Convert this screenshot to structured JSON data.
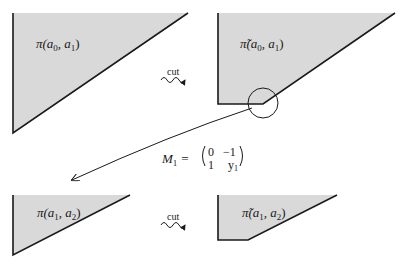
{
  "diagram": {
    "panels": [
      {
        "id": "top-left",
        "label_main": "π",
        "label_args": "(a",
        "sub1": "0",
        "comma": ", a",
        "sub2": "1",
        "close": ")"
      },
      {
        "id": "top-right",
        "label_main": "π̃",
        "label_args": "(a",
        "sub1": "0",
        "comma": ", a",
        "sub2": "1",
        "close": ")"
      },
      {
        "id": "bottom-left",
        "label_main": "π",
        "label_args": "(a",
        "sub1": "1",
        "comma": ", a",
        "sub2": "2",
        "close": ")"
      },
      {
        "id": "bottom-right",
        "label_main": "π̃",
        "label_args": "(a",
        "sub1": "1",
        "comma": ", a",
        "sub2": "2",
        "close": ")"
      }
    ],
    "cut_labels": [
      "cut",
      "cut"
    ],
    "matrix": {
      "name": "M",
      "sub": "1",
      "equals": "=",
      "rows": [
        [
          "0",
          "−1"
        ],
        [
          "1",
          "y"
        ]
      ],
      "y_sub": "1"
    },
    "colors": {
      "fill": "#d9d9d9",
      "stroke": "#1a1a1a"
    }
  }
}
